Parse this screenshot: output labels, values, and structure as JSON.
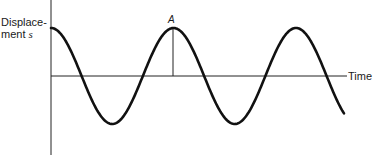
{
  "diagram": {
    "y_axis_label_line1": "Displace-",
    "y_axis_label_line2": "ment",
    "y_axis_symbol": "s",
    "x_axis_label": "Time",
    "point_label": "A",
    "curve": {
      "type": "cosine",
      "start_phase": "maximum",
      "periods_shown": 2.4
    },
    "colors": {
      "curve": "#111111",
      "axes": "#222222",
      "background": "#ffffff"
    }
  }
}
